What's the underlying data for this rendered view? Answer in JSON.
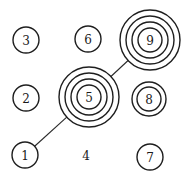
{
  "diagram": {
    "type": "grid-of-numbered-nodes",
    "connectors": [
      {
        "from": "1",
        "to": "5"
      },
      {
        "from": "5",
        "to": "9"
      }
    ],
    "nodes": [
      {
        "label": "1",
        "cx": 25,
        "cy": 155,
        "rings": [
          13
        ]
      },
      {
        "label": "2",
        "cx": 26,
        "cy": 98,
        "rings": [
          13
        ]
      },
      {
        "label": "3",
        "cx": 26,
        "cy": 40,
        "rings": [
          13
        ]
      },
      {
        "label": "4",
        "cx": 86,
        "cy": 155,
        "rings": []
      },
      {
        "label": "5",
        "cx": 89,
        "cy": 97,
        "rings": [
          30,
          24,
          18,
          12
        ]
      },
      {
        "label": "6",
        "cx": 88,
        "cy": 39,
        "rings": [
          13
        ]
      },
      {
        "label": "7",
        "cx": 150,
        "cy": 157,
        "rings": [
          13
        ]
      },
      {
        "label": "8",
        "cx": 149,
        "cy": 99,
        "rings": [
          17,
          12
        ]
      },
      {
        "label": "9",
        "cx": 150,
        "cy": 40,
        "rings": [
          30,
          24,
          18,
          12
        ]
      }
    ]
  }
}
